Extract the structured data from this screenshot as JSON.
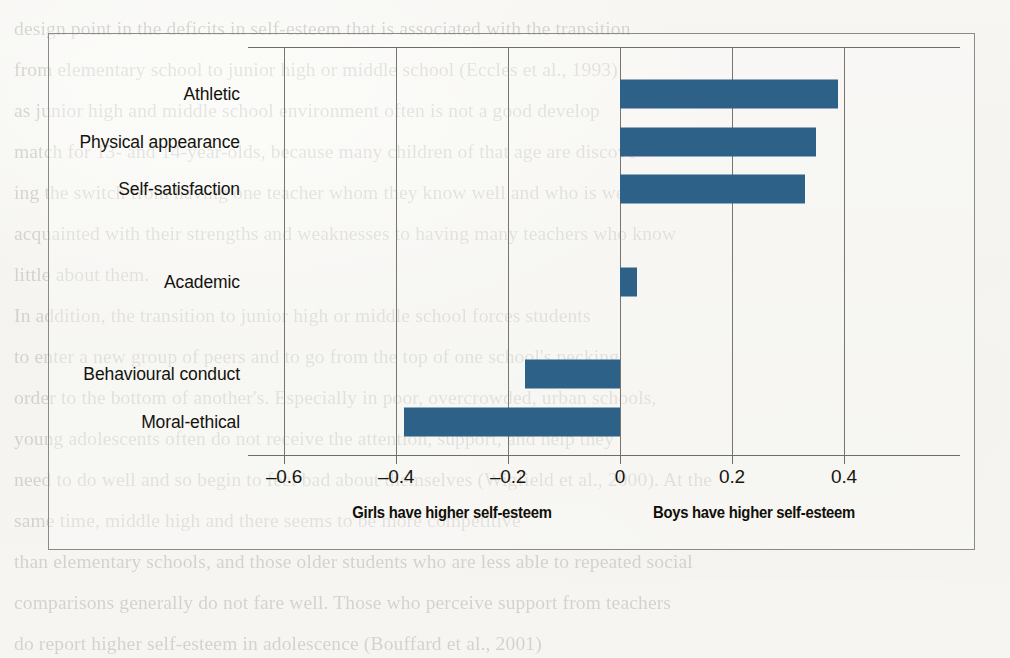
{
  "background": {
    "paper_color": "#f6f5f2",
    "bleed_through_lines": [
      "design point in the deficits in self-esteem that is associated with the transition",
      "from elementary school to junior high or middle school (Eccles et al., 1993)",
      "as junior high and middle school environment often is not a good develop",
      "match for 13- and 14-year-olds, because many children of that age are discove",
      "ing the switch from having one teacher whom they know well and who is well",
      "acquainted with their strengths and weaknesses to having many teachers who know",
      "little about them.",
      "In addition, the transition to junior high or middle school forces students",
      "to enter a new group of peers and to go from the top of one school's pecking",
      "order to the bottom of another's. Especially in poor, overcrowded, urban schools,",
      "young adolescents often do not receive the attention, support, and help they",
      "need to do well and so begin to feel bad about themselves (Wigfield et al., 2000). At the",
      "same time, middle high and there seems to be more competitive",
      "than elementary schools, and those older students who are less able to repeated social",
      "comparisons generally do not fare well. Those who perceive support from teachers",
      "do report higher self-esteem in adolescence (Bouffard et al., 2001)"
    ]
  },
  "chart_data": {
    "type": "bar",
    "orientation": "horizontal",
    "title": "",
    "subtitle": "",
    "xlabel": "",
    "ylabel": "",
    "xlim": [
      -0.665,
      0.607
    ],
    "grid": true,
    "grid_axis": "x",
    "legend_position": "none",
    "bar_color": "#2e6188",
    "zero_line": 0,
    "categories": [
      "Athletic",
      "Physical appearance",
      "Self-satisfaction",
      "Academic",
      "Behavioural conduct",
      "Moral-ethical"
    ],
    "values": [
      0.39,
      0.35,
      0.33,
      0.03,
      -0.17,
      -0.385
    ],
    "xticks": [
      -0.6,
      -0.4,
      -0.2,
      0,
      0.2,
      0.4
    ],
    "xtick_labels": [
      "–0.6",
      "–0.4",
      "–0.2",
      "0",
      "0.2",
      "0.4"
    ],
    "annotations": [
      {
        "text": "Girls have higher self-esteem",
        "at_value": -0.3
      },
      {
        "text": "Boys have higher self-esteem",
        "at_value": 0.24
      }
    ]
  }
}
